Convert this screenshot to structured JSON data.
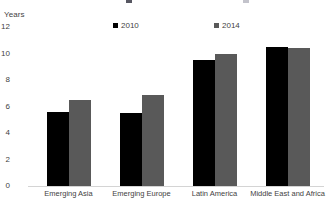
{
  "chart_data": {
    "type": "bar",
    "title": "",
    "subtitle": "",
    "xlabel": "",
    "ylabel": "Years",
    "ylim": [
      0,
      12
    ],
    "yticks": [
      0,
      2,
      4,
      6,
      8,
      10,
      12
    ],
    "ytick_labels": [
      "0",
      "2",
      "4",
      "6",
      "8",
      "10",
      "12"
    ],
    "grid": false,
    "legend_position": "top",
    "categories": [
      "Emerging Asia",
      "Emerging Europe",
      "Latin America",
      "Middle East and Africa"
    ],
    "series": [
      {
        "name": "2010",
        "color": "#000000",
        "values": [
          5.6,
          5.5,
          9.5,
          10.5
        ]
      },
      {
        "name": "2014",
        "color": "#595959",
        "values": [
          6.5,
          6.9,
          10.0,
          10.4
        ]
      }
    ]
  }
}
